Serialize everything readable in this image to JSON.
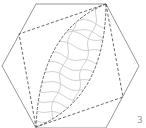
{
  "diagram": {
    "title": "",
    "shapes": {
      "hexagon": {
        "stroke": "#8a8a8a",
        "points": [
          [
            36,
            4
          ],
          [
            106,
            4
          ],
          [
            139,
            66
          ],
          [
            106,
            128
          ],
          [
            36,
            128
          ],
          [
            2,
            66
          ]
        ]
      },
      "square": {
        "stroke": "#555555",
        "dash": "3,2",
        "points": [
          [
            106,
            4
          ],
          [
            123,
            97
          ],
          [
            36,
            127
          ],
          [
            19,
            34
          ]
        ]
      },
      "lens": {
        "stroke": "#555555",
        "dash": "3,1.5",
        "from": [
          106,
          4
        ],
        "to": [
          36,
          127
        ]
      },
      "hatch": {
        "stroke": "#c4c4c4",
        "style": "wavy"
      }
    },
    "corner_mark": "3"
  }
}
